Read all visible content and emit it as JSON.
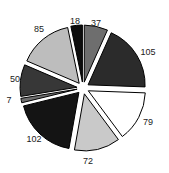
{
  "chart_data": {
    "type": "pie",
    "title": "",
    "subtitle": "",
    "xlabel": "",
    "ylabel": "",
    "legend": "none",
    "grid": false,
    "exploded": true,
    "total": 555,
    "categories": [
      "37",
      "105",
      "79",
      "72",
      "102",
      "7",
      "50",
      "85",
      "18"
    ],
    "values": [
      37,
      105,
      79,
      72,
      102,
      7,
      50,
      85,
      18
    ],
    "labels": [
      "37",
      "105",
      "79",
      "72",
      "102",
      "7",
      "50",
      "85",
      "18"
    ],
    "slice_colors": [
      "#6e6e6e",
      "#2b2b2b",
      "#ffffff",
      "#c9c9c9",
      "#141414",
      "#6e6e6e",
      "#373737",
      "#bdbdbd",
      "#0d0d0d"
    ],
    "outline_color": "#000000",
    "label_color": "#1a1a1a",
    "background_color": "#ffffff",
    "slices": [
      {
        "label": "37",
        "value": 37,
        "color": "#6e6e6e",
        "label_x": 96,
        "label_y": 23
      },
      {
        "label": "105",
        "value": 105,
        "color": "#2b2b2b",
        "label_x": 148,
        "label_y": 52
      },
      {
        "label": "79",
        "value": 79,
        "color": "#ffffff",
        "label_x": 148,
        "label_y": 122
      },
      {
        "label": "72",
        "value": 72,
        "color": "#c9c9c9",
        "label_x": 88,
        "label_y": 161
      },
      {
        "label": "102",
        "value": 102,
        "color": "#141414",
        "label_x": 34,
        "label_y": 139
      },
      {
        "label": "7",
        "value": 7,
        "color": "#6e6e6e",
        "label_x": 9,
        "label_y": 100
      },
      {
        "label": "50",
        "value": 50,
        "color": "#373737",
        "label_x": 15,
        "label_y": 79
      },
      {
        "label": "85",
        "value": 85,
        "color": "#bdbdbd",
        "label_x": 39,
        "label_y": 29
      },
      {
        "label": "18",
        "value": 18,
        "color": "#0d0d0d",
        "label_x": 75,
        "label_y": 21
      }
    ]
  }
}
